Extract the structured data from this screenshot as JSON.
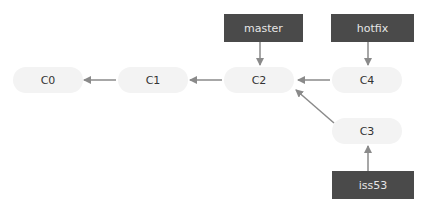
{
  "commits": {
    "c0": "C0",
    "c1": "C1",
    "c2": "C2",
    "c3": "C3",
    "c4": "C4"
  },
  "branches": {
    "master": "master",
    "hotfix": "hotfix",
    "iss53": "iss53"
  },
  "colors": {
    "branch_bg": "#4a4a4a",
    "commit_bg": "#f3f3f3",
    "arrow": "#8a8a8a"
  }
}
